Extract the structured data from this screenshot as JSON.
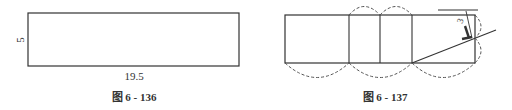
{
  "figures": [
    {
      "caption": "图 6 - 136",
      "width_label": "19.5",
      "height_label": "5"
    },
    {
      "caption": "图 6 - 137",
      "angle_label": "3"
    }
  ],
  "colors": {
    "line": "#333333",
    "dashed": "#555555"
  }
}
